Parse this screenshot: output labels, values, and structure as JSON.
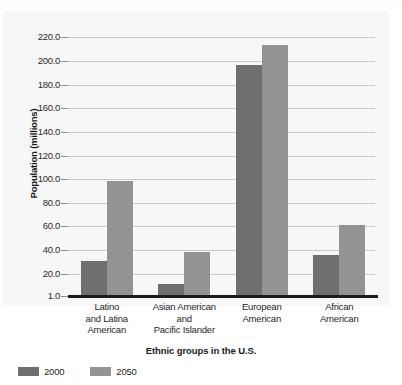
{
  "chart_data": {
    "type": "bar",
    "title": "",
    "xlabel": "Ethnic groups in the U.S.",
    "ylabel": "Population (millions)",
    "categories": [
      "Latino\nand Latina\nAmerican",
      "Asian American\nand\nPacific Islander",
      "European\nAmerican",
      "African\nAmerican"
    ],
    "category_lines": [
      [
        "Latino",
        "and Latina",
        "American"
      ],
      [
        "Asian American",
        "and",
        "Pacific Islander"
      ],
      [
        "European",
        "American"
      ],
      [
        "African",
        "American"
      ]
    ],
    "series": [
      {
        "name": "2000",
        "color": "#6f6f6f",
        "values": [
          31,
          11,
          197,
          36
        ]
      },
      {
        "name": "2050",
        "color": "#939393",
        "values": [
          98,
          38,
          214,
          61
        ]
      }
    ],
    "ylim": [
      1.0,
      228.0
    ],
    "ytick_values": [
      220.0,
      200.0,
      180.0,
      160.0,
      140.0,
      120.0,
      100.0,
      80.0,
      60.0,
      40.0,
      20.0,
      1.0
    ],
    "ytick_labels": [
      "220.0",
      "200.0",
      "180.0",
      "160.0",
      "140.0",
      "120.0",
      "100.0",
      "80.0",
      "60.0",
      "40.0",
      "20.0",
      "1.0"
    ],
    "grid": true,
    "grid_color": "#c9c9c9",
    "legend_position": "below-left",
    "panel_background": "#f7f7f7",
    "axis_color": "#1b1b1b"
  },
  "legend": {
    "items": [
      {
        "label": "2000",
        "color": "#6f6f6f"
      },
      {
        "label": "2050",
        "color": "#939393"
      }
    ]
  }
}
